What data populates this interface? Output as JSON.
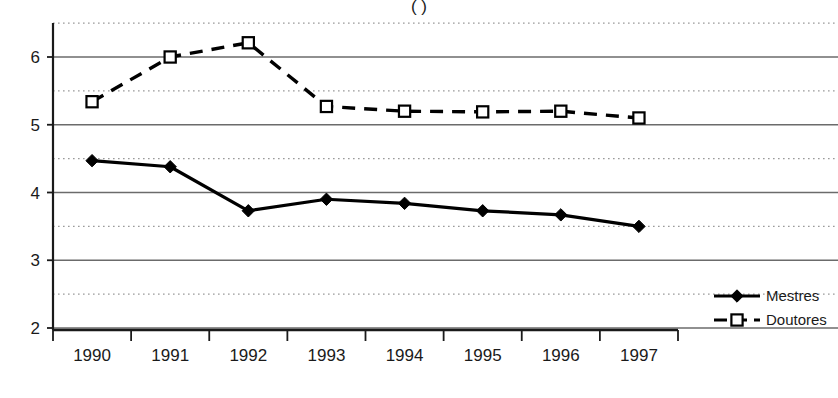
{
  "chart_data": {
    "type": "line",
    "title": "",
    "title_fragment_visible": "(  )",
    "xlabel": "",
    "ylabel": "",
    "categories": [
      "1990",
      "1991",
      "1992",
      "1993",
      "1994",
      "1995",
      "1996",
      "1997"
    ],
    "ylim": [
      2,
      6.5
    ],
    "yticks": [
      2,
      3,
      4,
      5,
      6
    ],
    "ytick_labels": [
      "2",
      "3",
      "4",
      "5",
      "6"
    ],
    "minor_yticks": [
      2.5,
      3.5,
      4.5,
      5.5,
      6.5
    ],
    "grid": "major solid horizontal, minor dotted horizontal",
    "legend_position": "right",
    "series": [
      {
        "name": "Mestres",
        "marker": "filled-diamond",
        "line_style": "solid",
        "color": "#000000",
        "values": [
          4.47,
          4.38,
          3.73,
          3.9,
          3.84,
          3.73,
          3.67,
          3.5
        ]
      },
      {
        "name": "Doutores",
        "marker": "open-square",
        "line_style": "dashed",
        "color": "#000000",
        "values": [
          5.34,
          6.0,
          6.21,
          5.27,
          5.2,
          5.19,
          5.2,
          5.1
        ]
      }
    ]
  },
  "legend": {
    "items": [
      {
        "label": "Mestres",
        "marker": "filled-diamond",
        "line_style": "solid"
      },
      {
        "label": "Doutores",
        "marker": "open-square",
        "line_style": "dashed"
      }
    ]
  },
  "axes": {
    "y_labels": [
      "6",
      "5",
      "4",
      "3",
      "2"
    ],
    "x_labels": [
      "1990",
      "1991",
      "1992",
      "1993",
      "1994",
      "1995",
      "1996",
      "1997"
    ]
  },
  "colors": {
    "axis": "#1a1a1a",
    "major_grid": "#6b6b6b",
    "minor_grid": "#9a9a9a",
    "series": "#000000",
    "background": "#ffffff"
  }
}
